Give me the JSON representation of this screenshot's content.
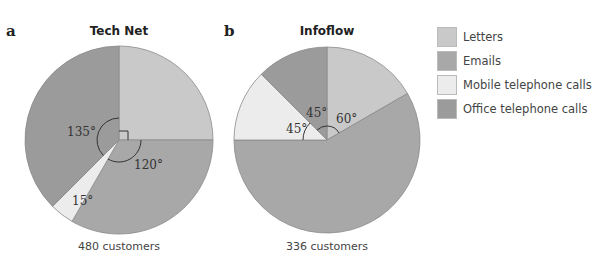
{
  "colors": {
    "Letters": "#c9c9c9",
    "Emails": "#a8a8a8",
    "Mobile telephone calls": "#ececec",
    "Office telephone calls": "#9b9b9b"
  },
  "legend": {
    "items": [
      {
        "label": "Letters",
        "color": "#c9c9c9"
      },
      {
        "label": "Emails",
        "color": "#a8a8a8"
      },
      {
        "label": "Mobile telephone calls",
        "color": "#ececec"
      },
      {
        "label": "Office telephone calls",
        "color": "#9b9b9b"
      }
    ]
  },
  "panels": [
    {
      "letter": "a",
      "title": "Tech Net",
      "caption": "480 customers"
    },
    {
      "letter": "b",
      "title": "Infoflow",
      "caption": "336 customers"
    }
  ],
  "chart_data": [
    {
      "type": "pie",
      "title": "Tech Net",
      "panel": "a",
      "caption": "480 customers",
      "total_customers": 480,
      "categories": [
        "Letters",
        "Emails",
        "Mobile telephone calls",
        "Office telephone calls"
      ],
      "angles_deg": [
        90,
        120,
        15,
        135
      ],
      "values": [
        120,
        160,
        20,
        180
      ],
      "angle_labels": [
        {
          "text": "",
          "note": "right-angle marker (90°) for Letters"
        },
        {
          "text": "120°"
        },
        {
          "text": "15°"
        },
        {
          "text": "135°"
        }
      ],
      "start_angle": "12 o'clock, clockwise",
      "legend_position": "right"
    },
    {
      "type": "pie",
      "title": "Infoflow",
      "panel": "b",
      "caption": "336 customers",
      "total_customers": 336,
      "categories": [
        "Letters",
        "Emails",
        "Mobile telephone calls",
        "Office telephone calls"
      ],
      "angles_deg": [
        60,
        210,
        45,
        45
      ],
      "values": [
        56,
        196,
        42,
        42
      ],
      "angle_labels": [
        {
          "text": "60°"
        },
        {
          "text": ""
        },
        {
          "text": "45°"
        },
        {
          "text": "45°"
        }
      ],
      "start_angle": "12 o'clock, clockwise",
      "legend_position": "right"
    }
  ]
}
